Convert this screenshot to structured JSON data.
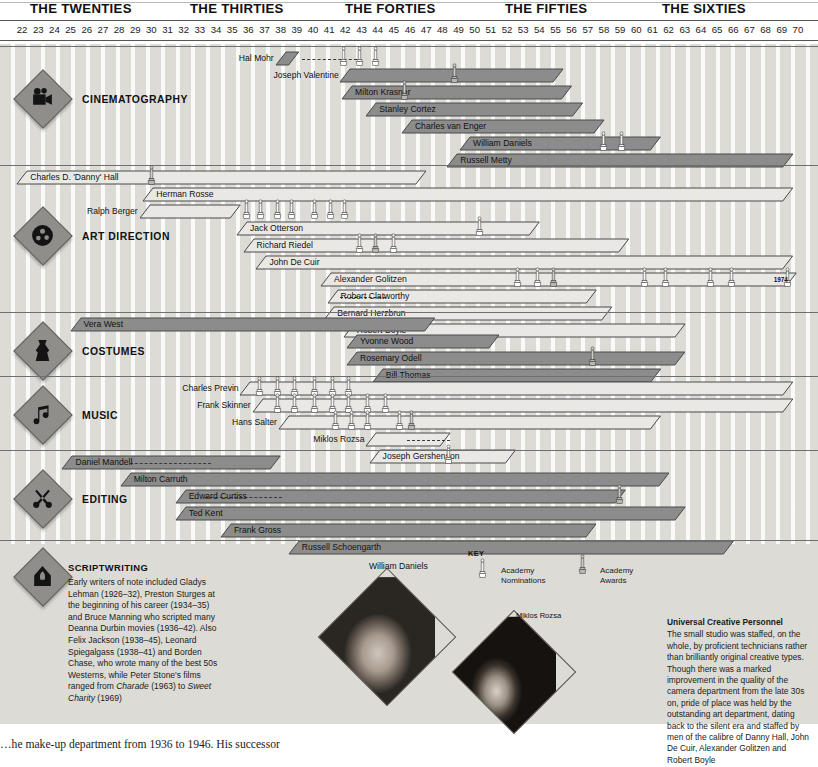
{
  "axis": {
    "decades": [
      {
        "label": "THE TWENTIES",
        "x": 30
      },
      {
        "label": "THE THIRTIES",
        "x": 190
      },
      {
        "label": "THE FORTIES",
        "x": 345
      },
      {
        "label": "THE FIFTIES",
        "x": 505
      },
      {
        "label": "THE SIXTIES",
        "x": 662
      }
    ],
    "year_start": 22,
    "year_end": 70,
    "years": [
      "22",
      "23",
      "24",
      "25",
      "26",
      "27",
      "28",
      "29",
      "30",
      "31",
      "32",
      "33",
      "34",
      "35",
      "36",
      "37",
      "38",
      "39",
      "40",
      "41",
      "42",
      "43",
      "44",
      "45",
      "46",
      "47",
      "48",
      "49",
      "50",
      "51",
      "52",
      "53",
      "54",
      "55",
      "56",
      "57",
      "58",
      "59",
      "60",
      "61",
      "62",
      "63",
      "64",
      "65",
      "66",
      "67",
      "68",
      "69",
      "70"
    ],
    "x0": 14,
    "x1": 806
  },
  "key": {
    "title": "KEY",
    "nominations_label_1": "Academy",
    "nominations_label_2": "Nominations",
    "awards_label_1": "Academy",
    "awards_label_2": "Awards"
  },
  "sections": [
    {
      "id": "cinematography",
      "name": "CINEMATOGRAPHY",
      "icon": "movie-camera-icon",
      "top": 46,
      "bottom": 165,
      "diamond_y": 78,
      "label_y": 94,
      "people": [
        {
          "name": "Hal Mohr",
          "start": 38.2,
          "end": 39.6,
          "row": 0,
          "style": "dark",
          "label_side": "left",
          "dash": {
            "from": 39.8,
            "to": 43.2
          }
        },
        {
          "name": "Joseph Valentine",
          "start": 42.2,
          "end": 56.0,
          "row": 1,
          "style": "dark",
          "label_side": "left"
        },
        {
          "name": "Milton Krasner",
          "start": 42.3,
          "end": 56.5,
          "row": 2,
          "style": "dark",
          "label_side": "on"
        },
        {
          "name": "Stanley Cortez",
          "start": 43.8,
          "end": 57.2,
          "row": 3,
          "style": "dark",
          "label_side": "on"
        },
        {
          "name": "Charles van Enger",
          "start": 46.0,
          "end": 58.5,
          "row": 4,
          "style": "dark",
          "label_side": "on"
        },
        {
          "name": "William Daniels",
          "start": 49.6,
          "end": 62.0,
          "row": 5,
          "style": "dark",
          "label_side": "on"
        },
        {
          "name": "Russell Metty",
          "start": 48.8,
          "end": 70.2,
          "row": 6,
          "style": "dark",
          "label_side": "on"
        }
      ],
      "oscars": [
        {
          "x": 42.1,
          "row": 0,
          "type": "nomination"
        },
        {
          "x": 43.1,
          "row": 0,
          "type": "nomination"
        },
        {
          "x": 44.1,
          "row": 0,
          "type": "nomination"
        },
        {
          "x": 49.0,
          "row": 1,
          "type": "award"
        },
        {
          "x": 45.9,
          "row": 2,
          "type": "award"
        },
        {
          "x": 58.2,
          "row": 5,
          "type": "nomination"
        },
        {
          "x": 59.3,
          "row": 5,
          "type": "nomination"
        }
      ]
    },
    {
      "id": "art-direction",
      "name": "ART DIRECTION",
      "icon": "film-reel-icon",
      "top": 165,
      "bottom": 312,
      "diamond_y": 215,
      "label_y": 231,
      "people": [
        {
          "name": "Charles D. 'Danny' Hall",
          "start": 22.2,
          "end": 47.5,
          "row": 0,
          "style": "light",
          "label_side": "on"
        },
        {
          "name": "Herman Rosse",
          "start": 30.0,
          "end": 70.2,
          "row": 1,
          "style": "light",
          "label_side": "on"
        },
        {
          "name": "Ralph Berger",
          "start": 29.8,
          "end": 36.0,
          "row": 2,
          "style": "light",
          "label_side": "left"
        },
        {
          "name": "Jack Otterson",
          "start": 35.8,
          "end": 54.5,
          "row": 3,
          "style": "light",
          "label_side": "on"
        },
        {
          "name": "Richard Riedel",
          "start": 36.2,
          "end": 60.0,
          "row": 4,
          "style": "light",
          "label_side": "on"
        },
        {
          "name": "John De Cuir",
          "start": 37.0,
          "end": 70.2,
          "row": 5,
          "style": "light",
          "label_side": "on"
        },
        {
          "name": "Alexander Golitzen",
          "start": 41.0,
          "end": 70.4,
          "row": 6,
          "style": "light",
          "label_side": "on"
        },
        {
          "name": "Robert Clatworthy",
          "start": 41.4,
          "end": 58.0,
          "row": 7,
          "style": "light",
          "label_side": "on",
          "dash": {
            "from": 42.2,
            "to": 45.0
          }
        },
        {
          "name": "Bernard Herzbrun",
          "start": 41.2,
          "end": 59.0,
          "row": 8,
          "style": "light",
          "label_side": "on"
        },
        {
          "name": "Robert Boyle",
          "start": 42.4,
          "end": 63.5,
          "row": 9,
          "style": "light",
          "label_side": "on"
        }
      ],
      "end_marker": {
        "label": "1974",
        "x": 69.0
      },
      "oscars": [
        {
          "x": 30.2,
          "row": 0,
          "type": "award"
        },
        {
          "x": 36.1,
          "row": 2,
          "type": "nomination"
        },
        {
          "x": 37.0,
          "row": 2,
          "type": "nomination"
        },
        {
          "x": 38.0,
          "row": 2,
          "type": "nomination"
        },
        {
          "x": 38.9,
          "row": 2,
          "type": "nomination"
        },
        {
          "x": 40.3,
          "row": 2,
          "type": "nomination"
        },
        {
          "x": 41.3,
          "row": 2,
          "type": "nomination"
        },
        {
          "x": 42.2,
          "row": 2,
          "type": "nomination"
        },
        {
          "x": 43.1,
          "row": 4,
          "type": "nomination"
        },
        {
          "x": 44.1,
          "row": 4,
          "type": "award"
        },
        {
          "x": 45.2,
          "row": 4,
          "type": "nomination"
        },
        {
          "x": 50.5,
          "row": 3,
          "type": "nomination"
        },
        {
          "x": 52.9,
          "row": 6,
          "type": "nomination"
        },
        {
          "x": 54.1,
          "row": 6,
          "type": "nomination"
        },
        {
          "x": 55.1,
          "row": 6,
          "type": "award"
        },
        {
          "x": 60.7,
          "row": 6,
          "type": "nomination"
        },
        {
          "x": 62.0,
          "row": 6,
          "type": "nomination"
        },
        {
          "x": 64.8,
          "row": 6,
          "type": "nomination"
        },
        {
          "x": 66.1,
          "row": 6,
          "type": "nomination"
        },
        {
          "x": 69.6,
          "row": 6,
          "type": "nomination"
        }
      ]
    },
    {
      "id": "costumes",
      "name": "COSTUMES",
      "icon": "dress-icon",
      "top": 312,
      "bottom": 376,
      "diamond_y": 330,
      "label_y": 346,
      "people": [
        {
          "name": "Vera West",
          "start": 25.5,
          "end": 48.0,
          "row": 0,
          "style": "dark",
          "label_side": "on"
        },
        {
          "name": "Yvonne Wood",
          "start": 42.6,
          "end": 52.0,
          "row": 1,
          "style": "dark",
          "label_side": "on"
        },
        {
          "name": "Rosemary Odell",
          "start": 42.6,
          "end": 63.5,
          "row": 2,
          "style": "dark",
          "label_side": "on"
        },
        {
          "name": "Bill Thomas",
          "start": 44.2,
          "end": 62.0,
          "row": 3,
          "style": "dark",
          "label_side": "on"
        }
      ],
      "oscars": [
        {
          "x": 57.5,
          "row": 2,
          "type": "award"
        }
      ]
    },
    {
      "id": "music",
      "name": "MUSIC",
      "icon": "music-note-icon",
      "top": 376,
      "bottom": 450,
      "diamond_y": 394,
      "label_y": 410,
      "people": [
        {
          "name": "Charles Previn",
          "start": 36.0,
          "end": 70.2,
          "row": 0,
          "style": "light",
          "label_side": "left"
        },
        {
          "name": "Frank Skinner",
          "start": 36.8,
          "end": 70.2,
          "row": 1,
          "style": "light",
          "label_side": "left"
        },
        {
          "name": "Hans Salter",
          "start": 38.4,
          "end": 62.0,
          "row": 2,
          "style": "light",
          "label_side": "left"
        },
        {
          "name": "Miklos Rozsa",
          "start": 43.8,
          "end": 49.0,
          "row": 3,
          "style": "light",
          "label_side": "left",
          "dash": {
            "from": 46.3,
            "to": 49.0
          }
        },
        {
          "name": "Joseph Gershenson",
          "start": 44.0,
          "end": 53.0,
          "row": 4,
          "style": "light",
          "label_side": "on"
        }
      ],
      "oscars": [
        {
          "x": 36.9,
          "row": 0,
          "type": "nomination"
        },
        {
          "x": 38.0,
          "row": 0,
          "type": "nomination"
        },
        {
          "x": 39.1,
          "row": 0,
          "type": "nomination"
        },
        {
          "x": 40.3,
          "row": 0,
          "type": "nomination"
        },
        {
          "x": 41.4,
          "row": 0,
          "type": "nomination"
        },
        {
          "x": 42.4,
          "row": 0,
          "type": "nomination"
        },
        {
          "x": 38.0,
          "row": 1,
          "type": "nomination"
        },
        {
          "x": 39.1,
          "row": 1,
          "type": "nomination"
        },
        {
          "x": 40.3,
          "row": 1,
          "type": "nomination"
        },
        {
          "x": 41.4,
          "row": 1,
          "type": "nomination"
        },
        {
          "x": 42.4,
          "row": 1,
          "type": "nomination"
        },
        {
          "x": 43.6,
          "row": 1,
          "type": "nomination"
        },
        {
          "x": 44.7,
          "row": 1,
          "type": "nomination"
        },
        {
          "x": 41.6,
          "row": 2,
          "type": "nomination"
        },
        {
          "x": 42.6,
          "row": 2,
          "type": "nomination"
        },
        {
          "x": 43.6,
          "row": 2,
          "type": "nomination"
        },
        {
          "x": 45.6,
          "row": 2,
          "type": "nomination"
        },
        {
          "x": 46.3,
          "row": 2,
          "type": "award"
        },
        {
          "x": 48.6,
          "row": 4,
          "type": "nomination"
        }
      ]
    },
    {
      "id": "editing",
      "name": "EDITING",
      "icon": "scissors-icon",
      "top": 450,
      "bottom": 540,
      "diamond_y": 478,
      "label_y": 494,
      "people": [
        {
          "name": "Daniel Mandell",
          "start": 25.0,
          "end": 38.5,
          "row": 0,
          "style": "dark",
          "label_side": "on",
          "dash": {
            "from": 29.2,
            "to": 34.2
          }
        },
        {
          "name": "Milton Carruth",
          "start": 28.6,
          "end": 62.5,
          "row": 1,
          "style": "dark",
          "label_side": "on"
        },
        {
          "name": "Edward Curtiss",
          "start": 32.0,
          "end": 59.8,
          "row": 2,
          "style": "dark",
          "label_side": "on",
          "dash": {
            "from": 33.8,
            "to": 38.6
          }
        },
        {
          "name": "Ted Kent",
          "start": 32.0,
          "end": 63.5,
          "row": 3,
          "style": "dark",
          "label_side": "on"
        },
        {
          "name": "Frank Gross",
          "start": 34.8,
          "end": 58.0,
          "row": 4,
          "style": "dark",
          "label_side": "on"
        },
        {
          "name": "Russell Schoengarth",
          "start": 39.0,
          "end": 66.5,
          "row": 5,
          "style": "dark",
          "label_side": "on"
        }
      ],
      "oscars": [
        {
          "x": 59.2,
          "row": 2,
          "type": "award"
        }
      ]
    }
  ],
  "scriptwriting": {
    "heading": "SCRIPTWRITING",
    "icon": "quill-house-icon",
    "paragraph": "Early writers of note included Gladys Lehman (1926–32), Preston Sturges at the beginning of his career (1934–35) and Bruce Manning who scripted many Deanna Durbin movies (1936–42). Also Felix Jackson (1938–45), Leonard Spiegalgass (1938–41) and Borden Chase, who wrote many of the best 50s Westerns, while Peter Stone's films ranged from ",
    "italic1": "Charade",
    "mid": " (1963) to ",
    "italic2": "Sweet Charity",
    "tail": " (1969)"
  },
  "photos": [
    {
      "caption": "William Daniels",
      "name": "william-daniels-photo"
    },
    {
      "caption": "Miklos Rozsa",
      "name": "miklos-rozsa-photo"
    }
  ],
  "right_note": {
    "heading": "Universal Creative Personnel",
    "body": "The small studio was staffed, on the whole, by proficient technicians rather than brilliantly original creative types. Though there was a marked improvement in the quality of the camera department from the late 30s on, pride of place was held by the outstanding art department, dating back to the silent era and staffed by men of the calibre of Danny Hall, John De Cuir, Alexander Golitzen and Robert Boyle"
  },
  "footer": {
    "line": "…he make-up department from 1936 to 1946. His successor"
  },
  "colors": {
    "paper": "#dcdbd6",
    "bar_dark": "#8c8c8c",
    "bar_light": "#e9e8e4",
    "rule": "#6f6f6f",
    "diamond": "#8f8e8a",
    "text": "#1a1a1a"
  }
}
